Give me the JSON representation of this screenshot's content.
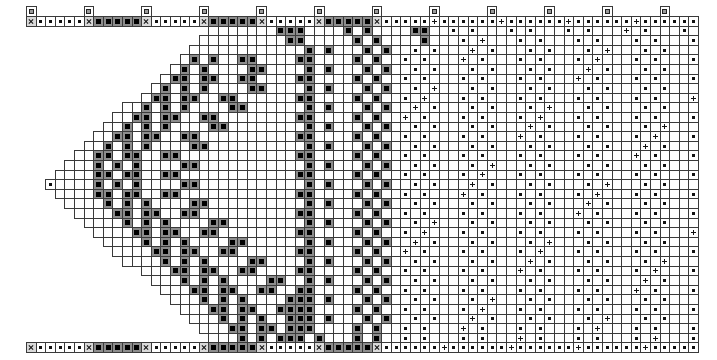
{
  "document": {
    "kind": "knitting-stitch-chart",
    "title": "",
    "background_color": "#ffffff",
    "grid_line_color": "#3a3a3a",
    "symbol_color": "#111111",
    "fill_color": "#8c8c8c"
  },
  "grid": {
    "cell_width": 9.6,
    "cell_height": 9.6,
    "origin_x": 26,
    "origin_y": 16,
    "columns": 70,
    "rows": 35,
    "header_row_index": 0,
    "footer_row_index": 34,
    "tick_row_index": -1
  },
  "legend": {
    "symbols": [
      {
        "key": "blank",
        "name": "empty-cell",
        "label": ""
      },
      {
        "key": "dot",
        "name": "dot-symbol",
        "label": "·"
      },
      {
        "key": "plus",
        "name": "plus-symbol",
        "label": "+"
      },
      {
        "key": "fill",
        "name": "filled-square-symbol",
        "label": "■"
      },
      {
        "key": "x",
        "name": "x-marker-symbol",
        "label": "×"
      },
      {
        "key": "tick",
        "name": "repeat-tick-symbol",
        "label": "□"
      }
    ]
  },
  "chart_data": {
    "type": "heatmap",
    "title": "",
    "xlabel": "",
    "ylabel": "",
    "columns": 70,
    "rows": 35,
    "legend": [
      "blank",
      "dot",
      "plus",
      "fill",
      "x",
      "tick"
    ],
    "rows_data": [
      "XdddddXfffffXdddddXfffffXdddddXfffffXdddddddddddddddddddddddddddddddddddddd",
      "..........................fff....f.f....ff..d.d...d.d...d.d...d.d...d.d...",
      "...........................ff.....f.f....f...d.d...d.d...d.d...d.d...d.d..",
      ".............................f.f...f.f..d.d...d.d...d.d...d.d...d.d...d.d.",
      "..........ddd....f.f..ff....ff....f.f..d.d...d.d...d.d...d.d...d.d...d.d..",
      ".........d.d....f.f....ff....f.f...f.f..d.d...d.d...d.d...d.d...d.d...d.d.",
      "........ddd....ff.ff..ff....ff....f.f..d.d...d.d...d.d...d.d...d.d...d.d..",
      ".......d.d....f.f.f....ff....f.f...f.f..d.d...d.d...d.d...d.d...d.d...d.d.",
      "......ddd....ff.ff..ff......ff....f.f..d.d...d.d...d.d...d.d...d.d...d.d..",
      ".....d.d....f.f.f....ff......f.f...f.f..d.d...d.d...d.d...d.d...d.d...d.d.",
      "....ddd....ff.ff..ff........ff....f.f..d.d...d.d...d.d...d.d...d.d...d.d..",
      "...d.d....f.f.f....ff........f.f...f.f..d.d...d.d...d.d...d.d...d.d...d.d.",
      "..ddd....ff.ff..ff..........ff....f.f..d.d...d.d...d.d...d.d...d.d...d.d..",
      ".d.d....f.f.f....ff..........f.f...f.f..d.d...d.d...d.d...d.d...d.d...d.d.",
      "ddd....ff.ff..ff............ff....f.f..d.d...d.d...d.d...d.d...d.d...d.d..",
      "d.d....f.f.f....ff...........f.f...f.f..d.d...d.d...d.d...d.d...d.d...d.d.",
      "ddd....ff.ff..ff............ff....f.f..d.d...d.d...d.d...d.d...d.d...d.d..",
      "d.d....f.f.f....ff...........f.f...f.f..d.d...d.d...d.d...d.d...d.d...d.d.",
      "ddd....ff.ff..ff............ff....f.f..d.d...d.d...d.d...d.d...d.d...d.d..",
      ".d.d....f.f.f....ff..........f.f...f.f..d.d...d.d...d.d...d.d...d.d...d.d.",
      "..ddd....ff.ff..ff..........ff....f.f..d.d...d.d...d.d...d.d...d.d...d.d..",
      "...d.d....f.f.f....ff........f.f...f.f..d.d...d.d...d.d...d.d...d.d...d.d.",
      "....ddd....ff.ff..ff........ff....f.f..d.d...d.d...d.d...d.d...d.d...d.d..",
      ".....d.d....f.f.f....ff......f.f...f.f..d.d...d.d...d.d...d.d...d.d...d.d.",
      "......ddd....ff.ff..ff......ff....f.f..d.d...d.d...d.d...d.d...d.d...d.d..",
      ".......d.d....f.f.f....ff....f.f...f.f..d.d...d.d...d.d...d.d...d.d...d.d.",
      "........ddd....ff.ff..ff....ff....f.f..d.d...d.d...d.d...d.d...d.d...d.d..",
      ".........d.d....f.f.f....ff..f.f...f.f..d.d...d.d...d.d...d.d...d.d...d.d.",
      "..........ddd....ff.ff..ff..ff....f.f..d.d...d.d...d.d...d.d...d.d...d.d..",
      "...........d.d....f.f.f....fff.f...f.f..d.d...d.d...d.d...d.d...d.d...d.d.",
      "............ddd....ff.ff..ffff....f.f..d.d...d.d...d.d...d.d...d.d...d.d..",
      ".............d.d....f.f.f..fff.f...f.f..d.d...d.d...d.d...d.d...d.d...d.d.",
      "..............ddd....ff.ff.fff....f.f..d.d...d.d...d.d...d.d...d.d...d.d..",
      "...............d.d....f.f.fff.f...f.f..d.d...d.d...d.d...d.d...d.d...d.d..",
      "XdddddXfffffXdddddXfffffXdddddXfffffXdddddddddddddddddddddddddddddddddddd"
    ]
  }
}
